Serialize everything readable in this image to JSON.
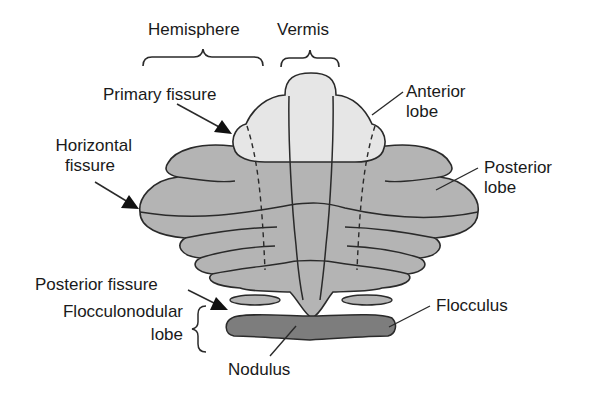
{
  "diagram": {
    "colors": {
      "anterior_lobe": "#e6e6e6",
      "posterior_lobe": "#b4b4b4",
      "flocculonodular_lobe": "#7d7d7d",
      "outline": "#2a2a2a",
      "background": "#ffffff"
    },
    "labels": {
      "hemisphere": "Hemisphere",
      "vermis": "Vermis",
      "primary_fissure": "Primary fissure",
      "anterior_lobe_1": "Anterior",
      "anterior_lobe_2": "lobe",
      "horizontal_fissure_1": "Horizontal",
      "horizontal_fissure_2": "fissure",
      "posterior_lobe_1": "Posterior",
      "posterior_lobe_2": "lobe",
      "posterior_fissure": "Posterior fissure",
      "flocculonodular_lobe_1": "Flocculonodular",
      "flocculonodular_lobe_2": "lobe",
      "flocculus": "Flocculus",
      "nodulus": "Nodulus"
    }
  }
}
